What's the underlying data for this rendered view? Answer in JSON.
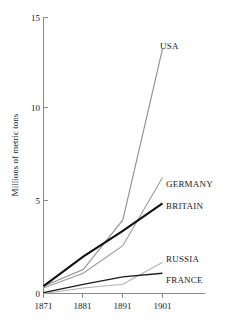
{
  "chart_data": {
    "type": "line",
    "title": "",
    "subtitle": "",
    "xlabel": "",
    "ylabel": "Millions of metric tons",
    "x": [
      1871,
      1881,
      1891,
      1901
    ],
    "xtick_labels": [
      "1871",
      "1881",
      "1891",
      "1901"
    ],
    "ytick_labels": [
      "0",
      "5",
      "10",
      "15"
    ],
    "ytick_values": [
      0,
      5,
      10,
      15
    ],
    "xlim": [
      1871,
      1901
    ],
    "ylim": [
      0,
      15
    ],
    "grid": false,
    "legend_position": "right-inline-labels",
    "series": [
      {
        "name": "USA",
        "label": "USA",
        "color": "#8f8f8f",
        "width": 1.1,
        "values": [
          0.4,
          1.3,
          4.0,
          13.3
        ]
      },
      {
        "name": "GERMANY",
        "label": "GERMANY",
        "color": "#9a9a9a",
        "width": 1.1,
        "values": [
          0.3,
          1.1,
          2.6,
          6.3
        ]
      },
      {
        "name": "BRITAIN",
        "label": "BRITAIN",
        "color": "#111111",
        "width": 2.1,
        "values": [
          0.4,
          2.0,
          3.4,
          4.9
        ]
      },
      {
        "name": "RUSSIA",
        "label": "RUSSIA",
        "color": "#b2b2b2",
        "width": 1.1,
        "values": [
          0.0,
          0.3,
          0.5,
          1.7
        ]
      },
      {
        "name": "FRANCE",
        "label": "FRANCE",
        "color": "#1a1a1a",
        "width": 1.3,
        "values": [
          0.05,
          0.5,
          0.9,
          1.1
        ]
      }
    ]
  },
  "axes": {
    "y_axis_title": "Millions of metric tons",
    "y_ticks": [
      {
        "label": "15",
        "value": 15
      },
      {
        "label": "10",
        "value": 10
      },
      {
        "label": "5",
        "value": 5
      },
      {
        "label": "0",
        "value": 0
      }
    ],
    "x_ticks": [
      {
        "label": "1871",
        "value": 1871
      },
      {
        "label": "1881",
        "value": 1881
      },
      {
        "label": "1891",
        "value": 1891
      },
      {
        "label": "1901",
        "value": 1901
      }
    ]
  },
  "series_labels": {
    "usa": "USA",
    "germany": "GERMANY",
    "britain": "BRITAIN",
    "russia": "RUSSIA",
    "france": "FRANCE"
  }
}
